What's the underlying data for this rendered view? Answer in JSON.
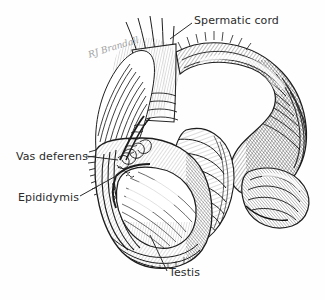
{
  "figure": {
    "medium": "ink-engraving-hatching",
    "background_color": "#fefefe",
    "ink_color": "#1d1d1d",
    "label_color": "#2b2b2b"
  },
  "signature": {
    "text": "RJ Brandall",
    "color": "#8e8e8e"
  },
  "labels": [
    {
      "id": "spermatic-cord",
      "text": "Spermatic cord",
      "x": 194,
      "y": 14,
      "leader": {
        "x1": 192,
        "y1": 23,
        "x2": 170,
        "y2": 39
      }
    },
    {
      "id": "vas-deferens",
      "text": "Vas deferens",
      "x": 16,
      "y": 150,
      "leader": {
        "x1": 86,
        "y1": 156,
        "x2": 118,
        "y2": 160
      }
    },
    {
      "id": "epididymis",
      "text": "Epididymis",
      "x": 18,
      "y": 191,
      "leader": {
        "x1": 80,
        "y1": 196,
        "x2": 116,
        "y2": 176
      }
    },
    {
      "id": "testis",
      "text": "Testis",
      "x": 169,
      "y": 266,
      "leader": {
        "x1": 167,
        "y1": 271,
        "x2": 150,
        "y2": 235
      }
    }
  ],
  "structures": [
    {
      "id": "spermatic-cord-body",
      "description": "fibrous cord ascending to upper left"
    },
    {
      "id": "penis-shaft",
      "description": "large arcing hatched shaft curving right and down"
    },
    {
      "id": "glans-prepuce",
      "description": "folded distal tip at lower right"
    },
    {
      "id": "scrotum",
      "description": "opened scrotal sac with cut fringed wall"
    },
    {
      "id": "testis-body",
      "description": "pale ovoid testis within scrotum"
    },
    {
      "id": "epididymis-body",
      "description": "coiled tube along testis margin"
    },
    {
      "id": "vas-deferens-body",
      "description": "convoluted duct ascending from epididymis"
    }
  ]
}
